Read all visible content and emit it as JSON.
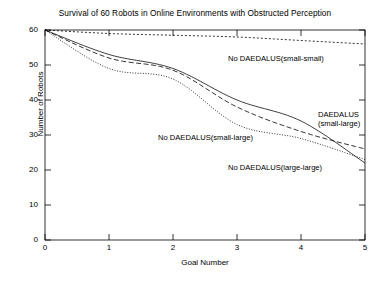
{
  "chart_data": {
    "type": "line",
    "title": "Survival of 60 Robots in Online Environments with Obstructed Perception",
    "xlabel": "Goal Number",
    "ylabel": "Number of Robots",
    "xlim": [
      0,
      5
    ],
    "ylim": [
      0,
      60
    ],
    "xticks": [
      "0",
      "1",
      "2",
      "3",
      "4",
      "5"
    ],
    "yticks": [
      "0",
      "10",
      "20",
      "30",
      "40",
      "50",
      "60"
    ],
    "grid": false,
    "legend_position": "inline-annotations",
    "x": [
      0,
      1,
      2,
      3,
      4,
      5
    ],
    "series": [
      {
        "name": "No DAEDALUS(small-small)",
        "style": "dotted",
        "values": [
          60,
          59,
          58.5,
          58,
          57,
          56
        ]
      },
      {
        "name": "DAEDALUS(small-large)",
        "style": "solid",
        "values": [
          60,
          53,
          49,
          40,
          34,
          22
        ]
      },
      {
        "name": "No DAEDALUS(small-large)",
        "style": "dashed",
        "values": [
          60,
          52,
          48.5,
          38,
          31,
          26
        ]
      },
      {
        "name": "No DAEDALUS(large-large)",
        "style": "fine-dotted",
        "values": [
          60,
          49,
          46,
          33,
          29,
          23
        ]
      }
    ],
    "annotations": [
      {
        "text": "No DAEDALUS(small-small)",
        "x_px": 228,
        "y_px": 54
      },
      {
        "text": "DAEDALUS",
        "x_px": 318,
        "y_px": 110
      },
      {
        "text": "(small-large)",
        "x_px": 318,
        "y_px": 119
      },
      {
        "text": "No DAEDALUS(small-large)",
        "x_px": 158,
        "y_px": 133
      },
      {
        "text": "No DAEDALUS(large-large)",
        "x_px": 228,
        "y_px": 163
      }
    ]
  }
}
